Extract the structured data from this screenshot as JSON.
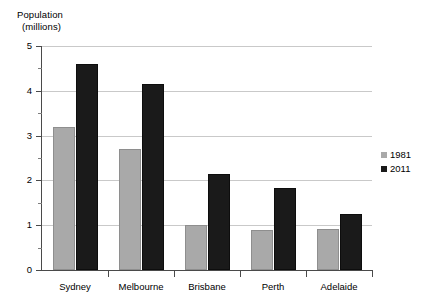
{
  "chart_data": {
    "type": "bar",
    "title": "",
    "subtitle": "",
    "xlabel": "",
    "ylabel": "Population (millions)",
    "ylabel_line1": "Population",
    "ylabel_line2": "(millions)",
    "categories": [
      "Sydney",
      "Melbourne",
      "Brisbane",
      "Perth",
      "Adelaide"
    ],
    "series": [
      {
        "name": "1981",
        "color": "#a9a9a9",
        "values": [
          3.2,
          2.7,
          1.0,
          0.9,
          0.92
        ]
      },
      {
        "name": "2011",
        "color": "#1a1a1a",
        "values": [
          4.6,
          4.15,
          2.15,
          1.82,
          1.25
        ]
      }
    ],
    "ylim": [
      0,
      5
    ],
    "ytick_labels": [
      "0",
      "1",
      "2",
      "3",
      "4",
      "5"
    ],
    "ytick_values": [
      0,
      1,
      2,
      3,
      4,
      5
    ],
    "yminor_values": [
      0.5,
      1.5,
      2.5,
      3.5,
      4.5
    ],
    "grid": true,
    "grid_axis": "y",
    "legend_position": "right",
    "legend_entries": [
      {
        "label": "1981",
        "color": "#a9a9a9"
      },
      {
        "label": "2011",
        "color": "#1a1a1a"
      }
    ],
    "background_color": "#ffffff",
    "axis_color": "#4a4a4a",
    "grid_color": "#c9c9c9"
  }
}
